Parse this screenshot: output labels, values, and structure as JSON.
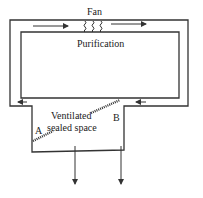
{
  "diagram": {
    "labels": {
      "fan": "Fan",
      "purification": "Purification",
      "ventilated_line1": "Ventilated",
      "ventilated_line2": "sealed space",
      "point_a": "A",
      "point_b": "B"
    },
    "flow": {
      "top_duct": "left-to-right",
      "bottom_duct": "right-to-left",
      "exhaust": "downward"
    },
    "colors": {
      "line": "#333333",
      "text": "#222222",
      "background": "#ffffff"
    }
  }
}
